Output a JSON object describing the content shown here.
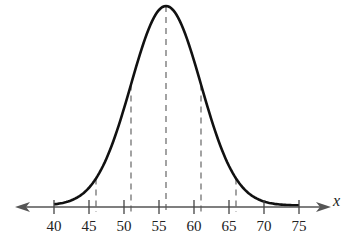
{
  "chart_data": {
    "type": "line",
    "title": "",
    "subtitle": "",
    "xlabel": "x",
    "ylabel": "",
    "xlim": [
      37,
      78
    ],
    "ticks": [
      40,
      45,
      50,
      55,
      60,
      65,
      70,
      75
    ],
    "tick_labels": [
      "40",
      "45",
      "50",
      "55",
      "60",
      "65",
      "70",
      "75"
    ],
    "distribution": {
      "mean": 56,
      "std": 5
    },
    "dashed_lines_x": [
      46,
      51,
      56,
      61,
      66
    ],
    "grid": false,
    "legend": null,
    "colors": {
      "curve": "#111111",
      "axis": "#555555",
      "dashes": "#666666"
    }
  }
}
